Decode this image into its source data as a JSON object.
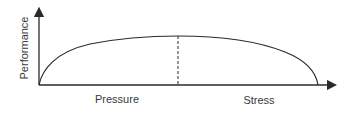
{
  "diagram": {
    "type": "performance-pressure curve",
    "y_axis_label": "Performance",
    "x_labels": {
      "left": "Pressure",
      "right": "Stress"
    },
    "colors": {
      "line": "#2a2a2a",
      "text": "#3a3a3a",
      "background": "#ffffff"
    },
    "peak_marker": "dashed vertical line at curve maximum"
  }
}
